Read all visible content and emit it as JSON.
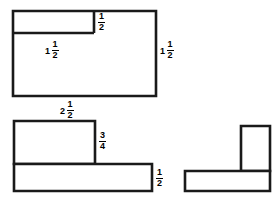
{
  "page": {
    "background_color": "#ffffff",
    "stroke_color": "#1a1a1a",
    "width": 276,
    "height": 207
  },
  "figures": [
    {
      "id": "figure-top-left",
      "name": "notched-rectangle",
      "shape": "rectangle with rectangular notch removed from upper-left interior",
      "labels": [
        {
          "id": "notch-height",
          "whole": "",
          "numerator": "1",
          "denominator": "2",
          "text": "1/2"
        },
        {
          "id": "notch-width",
          "whole": "1",
          "numerator": "1",
          "denominator": "2",
          "text": "1 1/2"
        },
        {
          "id": "right-height",
          "whole": "1",
          "numerator": "1",
          "denominator": "2",
          "text": "1 1/2"
        },
        {
          "id": "bottom-width",
          "whole": "2",
          "numerator": "1",
          "denominator": "2",
          "text": "2 1/2"
        }
      ]
    },
    {
      "id": "figure-bottom-left",
      "name": "stepped-l-shape",
      "shape": "L-shaped figure made of an upper rectangle sitting on a wider lower bar",
      "labels": [
        {
          "id": "upper-height",
          "whole": "",
          "numerator": "3",
          "denominator": "4",
          "text": "3/4"
        },
        {
          "id": "lower-height",
          "whole": "",
          "numerator": "1",
          "denominator": "2",
          "text": "1/2"
        }
      ]
    },
    {
      "id": "figure-bottom-right",
      "name": "unlabeled-l-shape",
      "shape": "L-shaped figure with a tall narrow rectangle rising from the right end of a horizontal bar",
      "labels": []
    }
  ],
  "colors": {
    "stroke": "#1a1a1a",
    "fill": "#ffffff",
    "text": "#000000"
  }
}
